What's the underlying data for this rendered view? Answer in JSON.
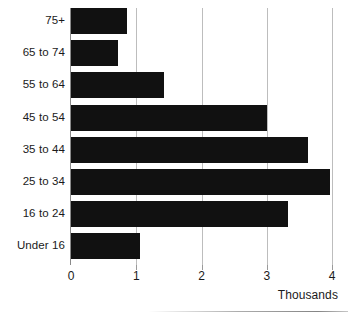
{
  "chart_data": {
    "type": "bar",
    "orientation": "horizontal",
    "title": "",
    "xlabel": "Thousands",
    "ylabel": "",
    "categories": [
      "75+",
      "65 to 74",
      "55 to 64",
      "45 to 54",
      "35 to 44",
      "25 to 34",
      "16 to 24",
      "Under 16"
    ],
    "values": [
      0.85,
      0.72,
      1.42,
      3.0,
      3.63,
      3.97,
      3.33,
      1.05
    ],
    "xlim": [
      0,
      4
    ],
    "xticks": [
      0,
      1,
      2,
      3,
      4
    ],
    "xticklabels": [
      "0",
      "1",
      "2",
      "3",
      "4"
    ],
    "grid": "vertical",
    "legend": "none",
    "bar_color": "#111111",
    "gridline_color": "#bdbdbd",
    "axis_color": "#8a8a8a",
    "text_color": "#1a1a1a"
  }
}
